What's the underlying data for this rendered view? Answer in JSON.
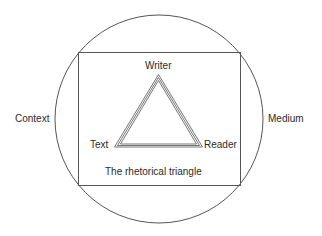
{
  "diagram": {
    "title": "The rhetorical triangle",
    "outer_circle": {
      "label_left": "Context",
      "label_right": "Medium"
    },
    "triangle": {
      "top": "Writer",
      "bottom_left": "Text",
      "bottom_right": "Reader"
    },
    "colors": {
      "stroke": "#555555",
      "text": "#2a2a2a",
      "background": "#ffffff"
    }
  }
}
